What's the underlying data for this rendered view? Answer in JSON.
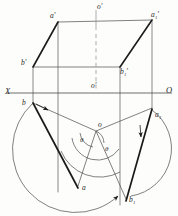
{
  "figure": {
    "colors": {
      "background": "#fdfdfb",
      "thin_line": "#4a4a4a",
      "thick_line": "#1a1a1a",
      "dashed_line": "#777777",
      "text": "#2a2a2a"
    }
  },
  "axis": {
    "left_label": "X",
    "right_label": "O",
    "y": 93,
    "x_start": 6,
    "x_end": 172
  },
  "front_view": {
    "name": "frontal-projection-parallelogram",
    "vertices": [
      {
        "id": "a_prime",
        "label": "a'",
        "x": 58,
        "y": 22,
        "label_x": 50,
        "label_y": 12
      },
      {
        "id": "a1_prime",
        "label": "a₁'",
        "x": 152,
        "y": 20,
        "label_x": 152,
        "label_y": 11
      },
      {
        "id": "b1_prime",
        "label": "b₁'",
        "x": 120,
        "y": 67,
        "label_x": 120,
        "label_y": 68
      },
      {
        "id": "b_prime",
        "label": "b'",
        "x": 33,
        "y": 67,
        "label_x": 22,
        "label_y": 60
      }
    ],
    "center_top_label": "o'",
    "center_top_label_x": 96,
    "center_top_label_y": 4,
    "center_axis_label": "o'",
    "center_axis_label_x": 92,
    "center_axis_label_y": 83
  },
  "top_view": {
    "name": "horizontal-projection-rotated-parallelogram",
    "vertices": [
      {
        "id": "b",
        "label": "b",
        "x": 33,
        "y": 103,
        "label_x": 22,
        "label_y": 101
      },
      {
        "id": "a1",
        "label": "a₁",
        "x": 152,
        "y": 108,
        "label_x": 155,
        "label_y": 112
      },
      {
        "id": "a",
        "label": "a",
        "x": 78,
        "y": 186,
        "label_x": 82,
        "label_y": 184
      },
      {
        "id": "b1",
        "label": "b₁",
        "x": 126,
        "y": 199,
        "label_x": 129,
        "label_y": 196
      },
      {
        "id": "o",
        "label": "o",
        "x": 96,
        "y": 131,
        "label_x": 98,
        "label_y": 122
      }
    ]
  },
  "angles": [
    {
      "id": "theta-left",
      "label": "θ",
      "x": 82,
      "y": 141
    },
    {
      "id": "theta-right",
      "label": "θ",
      "x": 106,
      "y": 150
    }
  ],
  "projection_lines": {
    "name": "vertical-projector-lines",
    "x_positions": [
      33,
      58,
      120,
      152
    ]
  },
  "arcs": {
    "count": 4,
    "description": "rotation arcs about centre o with arrowheads"
  }
}
